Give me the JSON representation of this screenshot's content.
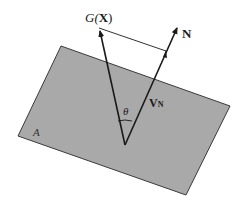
{
  "diagram": {
    "plane": {
      "label": "A",
      "fill": "#a9a9a9",
      "stroke": "#3a3a3a",
      "corners": [
        [
          61,
          46
        ],
        [
          230,
          106
        ],
        [
          186,
          195
        ],
        [
          18,
          136
        ]
      ]
    },
    "origin": [
      125,
      145
    ],
    "vectors": [
      {
        "name": "gradient",
        "label_main": "G(",
        "label_bold": "X",
        "label_close": ")",
        "tip": [
          99,
          28
        ]
      },
      {
        "name": "normal",
        "label": "N",
        "tip": [
          178,
          25
        ]
      },
      {
        "name": "projection",
        "label": "V",
        "subscript": "N",
        "tip": [
          166,
          51
        ]
      }
    ],
    "angle": {
      "label": "θ"
    },
    "connector": {
      "from": [
        99,
        28
      ],
      "to": [
        166,
        51
      ]
    },
    "colors": {
      "line": "#1a1a1a",
      "background": "#ffffff"
    }
  }
}
